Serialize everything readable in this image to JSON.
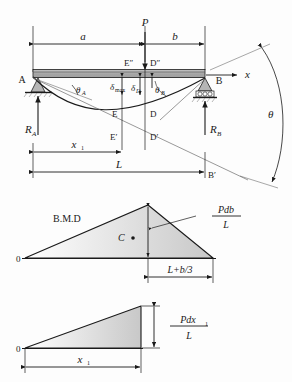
{
  "figure": {
    "background_color": "#fdfdfd",
    "line_color": "#1a1a1a",
    "beam_fill": "#b9b9b9",
    "shade_fill": "#d9d9d9"
  },
  "diagram_top": {
    "name": "beam-deflection-diagram",
    "load_label": "P",
    "dim_a": "a",
    "dim_b": "b",
    "dim_x1": "x",
    "dim_x1_sub": "1",
    "dim_L": "L",
    "support_A_label": "A",
    "support_B_label": "B",
    "reaction_A": "R",
    "reaction_A_sub": "A",
    "reaction_B": "R",
    "reaction_B_sub": "B",
    "axis_x": "x",
    "angle_theta_A": "θ",
    "angle_theta_A_sub": "A",
    "angle_theta_B": "θ",
    "angle_theta_B_sub": "B",
    "angle_theta": "θ",
    "delta_max": "δ",
    "delta_max_sub": "max",
    "delta_D": "δ",
    "delta_D_sub": "D",
    "point_E": "E",
    "point_D": "D",
    "point_E_prime": "E′",
    "point_D_prime": "D′",
    "point_E_dprime": "E″",
    "point_D_dprime": "D″",
    "point_B_prime": "B′"
  },
  "diagram_middle": {
    "name": "bending-moment-diagram",
    "label_bmd": "B.M.D",
    "origin_label": "0",
    "centroid_label": "C",
    "peak_value_numerator": "Pdb",
    "peak_value_denominator": "L",
    "base_dim": "L+b/3"
  },
  "diagram_bottom": {
    "name": "shear-triangle-diagram",
    "origin_label": "0",
    "height_numerator": "Pdx",
    "height_numerator_sub": "1",
    "height_denominator": "L",
    "base_dim": "x",
    "base_dim_sub": "1"
  }
}
